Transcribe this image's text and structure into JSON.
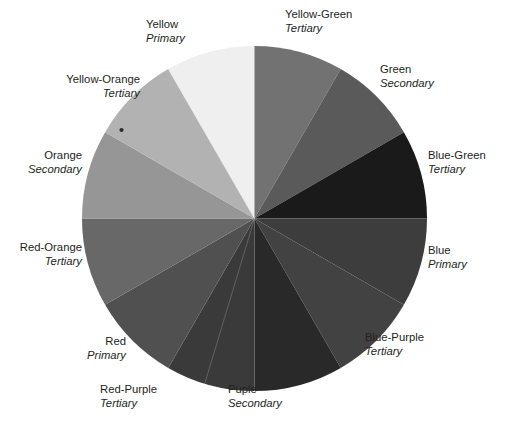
{
  "figure": {
    "kind": "color-wheel-diagram",
    "segment_count": 12
  },
  "chart_data": {
    "type": "pie",
    "title": "",
    "note": "Twelve-segment color wheel reproduced in grayscale; each wedge spans 30 degrees and is labelled with its hue name and its category (Primary, Secondary or Tertiary).",
    "categories": [
      "Yellow",
      "Yellow-Green",
      "Green",
      "Blue-Green",
      "Blue",
      "Blue-Purple",
      "Puple",
      "Red-Purple",
      "Red",
      "Red-Orange",
      "Orange",
      "Yellow-Orange"
    ],
    "values": [
      30,
      30,
      30,
      30,
      30,
      30,
      30,
      30,
      30,
      30,
      30,
      30
    ],
    "value_unit": "degrees",
    "series": [
      {
        "name": "Grayscale value",
        "values": [
          239,
          114,
          90,
          26,
          61,
          66,
          41,
          58,
          80,
          104,
          150,
          178
        ]
      }
    ],
    "legend_position": "around-wheel"
  },
  "wheel": {
    "segments": [
      {
        "name": "Yellow",
        "category": "Primary",
        "start_angle": -30,
        "end_angle": 0,
        "color": "#efefef",
        "label_align": "left"
      },
      {
        "name": "Yellow-Green",
        "category": "Tertiary",
        "start_angle": 0,
        "end_angle": 30,
        "color": "#727272",
        "label_align": "left"
      },
      {
        "name": "Green",
        "category": "Secondary",
        "start_angle": 30,
        "end_angle": 60,
        "color": "#5a5a5a",
        "label_align": "left"
      },
      {
        "name": "Blue-Green",
        "category": "Tertiary",
        "start_angle": 60,
        "end_angle": 90,
        "color": "#1a1a1a",
        "label_align": "left"
      },
      {
        "name": "Blue",
        "category": "Primary",
        "start_angle": 90,
        "end_angle": 120,
        "color": "#3d3d3d",
        "label_align": "left"
      },
      {
        "name": "Blue-Purple",
        "category": "Tertiary",
        "start_angle": 120,
        "end_angle": 150,
        "color": "#424242",
        "label_align": "left"
      },
      {
        "name": "Puple",
        "category": "Secondary",
        "start_angle": 150,
        "end_angle": 180,
        "color": "#292929",
        "label_align": "left"
      },
      {
        "name": "Red-Purple",
        "category": "Tertiary",
        "start_angle": 180,
        "end_angle": 210,
        "color": "#3a3a3a",
        "label_align": "left"
      },
      {
        "name": "Red",
        "category": "Primary",
        "start_angle": 210,
        "end_angle": 240,
        "color": "#505050",
        "label_align": "right"
      },
      {
        "name": "Red-Orange",
        "category": "Tertiary",
        "start_angle": 240,
        "end_angle": 270,
        "color": "#686868",
        "label_align": "right"
      },
      {
        "name": "Orange",
        "category": "Secondary",
        "start_angle": 270,
        "end_angle": 300,
        "color": "#969696",
        "label_align": "right"
      },
      {
        "name": "Yellow-Orange",
        "category": "Tertiary",
        "start_angle": 300,
        "end_angle": 330,
        "color": "#b2b2b2",
        "label_align": "right"
      }
    ]
  }
}
